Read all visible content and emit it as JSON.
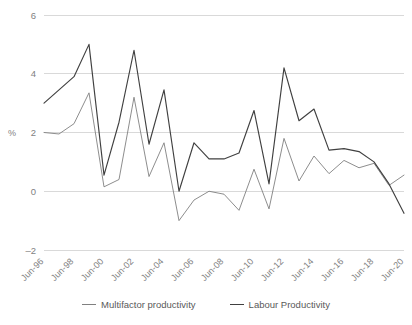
{
  "chart_data": {
    "type": "line",
    "title": "",
    "xlabel": "",
    "ylabel": "%",
    "ylim": [
      -2,
      6
    ],
    "yticks": [
      6,
      4,
      2,
      0,
      -2
    ],
    "grid": true,
    "legend_position": "bottom",
    "x": [
      "Jun-96",
      "Jun-97",
      "Jun-98",
      "Jun-99",
      "Jun-00",
      "Jun-01",
      "Jun-02",
      "Jun-03",
      "Jun-04",
      "Jun-05",
      "Jun-06",
      "Jun-07",
      "Jun-08",
      "Jun-09",
      "Jun-10",
      "Jun-11",
      "Jun-12",
      "Jun-13",
      "Jun-14",
      "Jun-15",
      "Jun-16",
      "Jun-17",
      "Jun-18",
      "Jun-19",
      "Jun-20"
    ],
    "xtick_labels": [
      "Jun-96",
      "Jun-98",
      "Jun-00",
      "Jun-02",
      "Jun-04",
      "Jun-06",
      "Jun-08",
      "Jun-10",
      "Jun-12",
      "Jun-14",
      "Jun-16",
      "Jun-18",
      "Jun-20"
    ],
    "series": [
      {
        "name": "Multifactor productivity",
        "color": "#808080",
        "width": 0.9,
        "values": [
          2.0,
          1.95,
          2.3,
          3.35,
          0.15,
          0.4,
          3.2,
          0.5,
          1.65,
          -1.0,
          -0.3,
          0.0,
          -0.1,
          -0.65,
          0.75,
          -0.6,
          1.8,
          0.35,
          1.2,
          0.6,
          1.05,
          0.8,
          0.95,
          0.2,
          0.55
        ]
      },
      {
        "name": "Labour Productivity",
        "color": "#404040",
        "width": 1.15,
        "values": [
          3.0,
          3.45,
          3.9,
          5.0,
          0.55,
          2.35,
          4.8,
          1.6,
          3.45,
          0.0,
          1.65,
          1.1,
          1.1,
          1.3,
          2.75,
          0.25,
          4.2,
          2.4,
          2.8,
          1.4,
          1.45,
          1.35,
          1.0,
          0.25,
          -0.75
        ]
      }
    ]
  },
  "legend": {
    "items": [
      {
        "label": "Multifactor productivity",
        "color": "#808080"
      },
      {
        "label": "Labour Productivity",
        "color": "#404040"
      }
    ]
  },
  "axis": {
    "y_title": "%"
  }
}
